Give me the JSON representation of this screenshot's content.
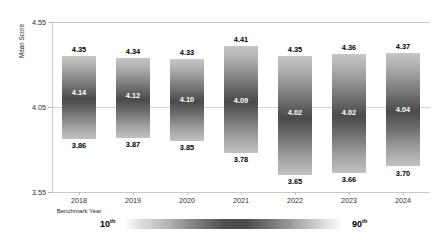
{
  "chart_data": {
    "type": "bar",
    "chart_subtype": "floating-range-bar",
    "title": "",
    "xlabel": "Benchmark Year",
    "ylabel": "Mean Score",
    "ylim": [
      3.55,
      4.55
    ],
    "yticks": [
      "3.55",
      "4.05",
      "4.55"
    ],
    "ytick_values": [
      3.55,
      4.05,
      4.55
    ],
    "grid": true,
    "legend_position": "bottom",
    "categories": [
      "2018",
      "2019",
      "2020",
      "2021",
      "2022",
      "2023",
      "2024"
    ],
    "series": [
      {
        "name": "10th percentile",
        "values": [
          3.86,
          3.87,
          3.85,
          3.78,
          3.65,
          3.66,
          3.7
        ]
      },
      {
        "name": "Mean Score",
        "values": [
          4.14,
          4.12,
          4.1,
          4.09,
          4.02,
          4.02,
          4.04
        ]
      },
      {
        "name": "90th percentile",
        "values": [
          4.35,
          4.34,
          4.33,
          4.41,
          4.35,
          4.36,
          4.37
        ]
      }
    ],
    "bars": [
      {
        "category": "2018",
        "top_label": "4.35",
        "mid_label": "4.14",
        "bottom_label": "3.86",
        "top": 4.35,
        "mid": 4.14,
        "bottom": 3.86
      },
      {
        "category": "2019",
        "top_label": "4.34",
        "mid_label": "4.12",
        "bottom_label": "3.87",
        "top": 4.34,
        "mid": 4.12,
        "bottom": 3.87
      },
      {
        "category": "2020",
        "top_label": "4.33",
        "mid_label": "4.10",
        "bottom_label": "3.85",
        "top": 4.33,
        "mid": 4.1,
        "bottom": 3.85
      },
      {
        "category": "2021",
        "top_label": "4.41",
        "mid_label": "4.09",
        "bottom_label": "3.78",
        "top": 4.41,
        "mid": 4.09,
        "bottom": 3.78
      },
      {
        "category": "2022",
        "top_label": "4.35",
        "mid_label": "4.02",
        "bottom_label": "3.65",
        "top": 4.35,
        "mid": 4.02,
        "bottom": 3.65
      },
      {
        "category": "2023",
        "top_label": "4.36",
        "mid_label": "4.02",
        "bottom_label": "3.66",
        "top": 4.36,
        "mid": 4.02,
        "bottom": 3.66
      },
      {
        "category": "2024",
        "top_label": "4.37",
        "mid_label": "4.04",
        "bottom_label": "3.70",
        "top": 4.37,
        "mid": 4.04,
        "bottom": 3.7
      }
    ],
    "legend": {
      "low_label": "10",
      "low_suffix": "th",
      "high_label": "90",
      "high_suffix": "th",
      "gradient_description": "percentile-band-grayscale"
    },
    "colors": {
      "bar_light": "#c6c6c6",
      "bar_dark": "#4a4a4a",
      "gridline": "#c9c9c9",
      "text": "#1a1a1a",
      "inner_label": "#ffffff",
      "background": "#ffffff"
    }
  }
}
